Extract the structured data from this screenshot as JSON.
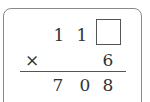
{
  "problem": {
    "type": "vertical-multiplication",
    "multiplicand": {
      "digits": [
        "1",
        "1",
        ""
      ],
      "missing_index": 2
    },
    "operator": "×",
    "multiplier": "6",
    "product": {
      "digits": [
        "7",
        "0",
        "8"
      ]
    }
  }
}
